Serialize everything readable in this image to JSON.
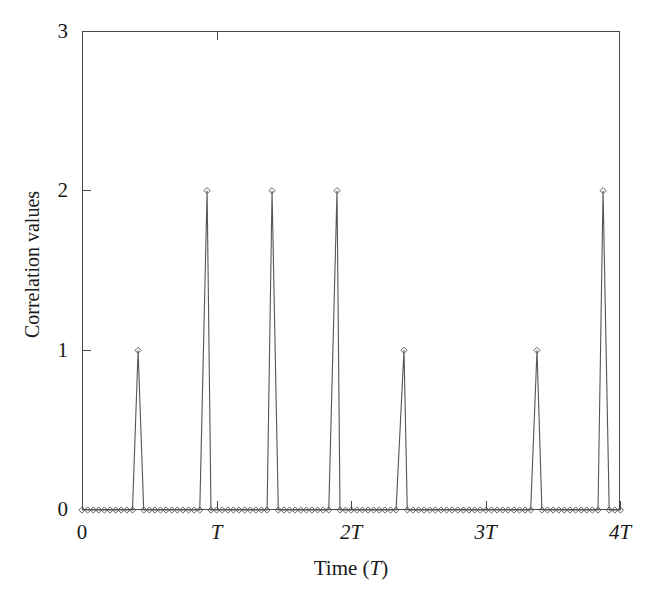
{
  "chart_data": {
    "type": "line",
    "title": "",
    "subtitle": "",
    "xlabel": "Time (T)",
    "ylabel": "Correlation values",
    "xlim": [
      0,
      4
    ],
    "ylim": [
      0,
      3
    ],
    "grid": false,
    "legend": "none",
    "x_unit": "T",
    "x_tick_values": [
      0,
      1,
      2,
      3,
      4
    ],
    "x_tick_labels": [
      "0",
      "T",
      "2T",
      "3T",
      "4T"
    ],
    "y_tick_values": [
      0,
      1,
      2,
      3
    ],
    "y_tick_labels": [
      "0",
      "1",
      "2",
      "3"
    ],
    "marker": "diamond",
    "line_color": "#555555",
    "marker_color": "#555555",
    "axis_color": "#4a4a4a",
    "baseline_value": 0,
    "sample_spacing_T": 0.0417,
    "peaks": [
      {
        "x": 0.417,
        "y": 1
      },
      {
        "x": 0.93,
        "y": 2
      },
      {
        "x": 1.413,
        "y": 2
      },
      {
        "x": 1.896,
        "y": 2
      },
      {
        "x": 2.394,
        "y": 1
      },
      {
        "x": 3.383,
        "y": 1
      },
      {
        "x": 3.874,
        "y": 2
      }
    ]
  },
  "axes": {
    "y_title": "Correlation values",
    "x_title_prefix": "Time (",
    "x_title_var": "T",
    "x_title_suffix": ")"
  }
}
